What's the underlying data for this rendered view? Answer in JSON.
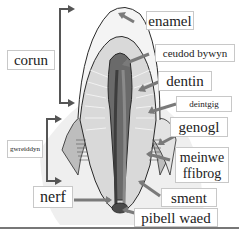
{
  "diagram": {
    "labels": {
      "enamel": "enamel",
      "pulp": "ceudod bywyn",
      "dentin": "dentin",
      "gum": "deintgig",
      "crown": "corun",
      "root": "gwreiddyn",
      "jawbone": "genogl",
      "fibrous_tissue_line1": "meinwe",
      "fibrous_tissue_line2": "ffibrog",
      "cementum": "sment",
      "nerve": "nerf",
      "blood_vessel": "pibell waed"
    },
    "colors": {
      "arrow": "#7a7a7a",
      "bracket": "#555555",
      "outline": "#2a2a2a",
      "dentin_fill": "#d9d9d9",
      "gum_fill": "#bdbdbd",
      "pulp_fill": "#5a5a5a",
      "background_tissue": "#ececec",
      "label_border": "#c8c8c8"
    }
  }
}
